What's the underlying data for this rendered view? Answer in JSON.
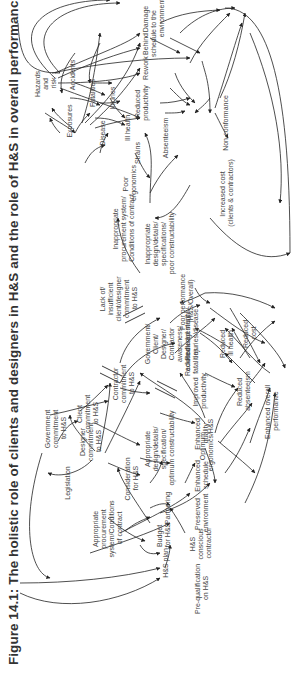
{
  "figure": {
    "title": "Figure 14.1: The holistic role of clients and designers in H&S and the role of H&S in overall performance",
    "orientation": "rotated 90 degrees counter-clockwise"
  },
  "left_diagram": {
    "nodes": [
      {
        "id": "legislation",
        "lines": [
          "Legislation"
        ]
      },
      {
        "id": "gov_commit",
        "lines": [
          "Government",
          "commitment",
          "to H&S"
        ]
      },
      {
        "id": "client_commit",
        "lines": [
          "Client",
          "commitment",
          "to H&S"
        ]
      },
      {
        "id": "designer_commit",
        "lines": [
          "Designer",
          "commitment",
          "to H&S"
        ]
      },
      {
        "id": "contractor_commit",
        "lines": [
          "Contractor",
          "commitment",
          "to H&S"
        ]
      },
      {
        "id": "approp_procurement",
        "lines": [
          "Appropriate",
          "procurement",
          "system/Conditions",
          "of contract"
        ]
      },
      {
        "id": "consideration",
        "lines": [
          "Consideration",
          "for H&S"
        ]
      },
      {
        "id": "approp_design",
        "lines": [
          "Appropriate",
          "design/details/",
          "specification/",
          "optimum constructability"
        ]
      },
      {
        "id": "hs_plan",
        "lines": [
          "H&S plan"
        ]
      },
      {
        "id": "budget",
        "lines": [
          "Budget",
          "for H&S"
        ]
      },
      {
        "id": "partnering",
        "lines": [
          "Partnering"
        ]
      },
      {
        "id": "prequal",
        "lines": [
          "Pre-qualification",
          "on H&S"
        ]
      },
      {
        "id": "hs_contractor",
        "lines": [
          "H&S",
          "conscious",
          "contractor"
        ]
      },
      {
        "id": "optimum_ergo",
        "lines": [
          "Optimum",
          "ergonomics/H&S"
        ]
      },
      {
        "id": "reduced_strains",
        "lines": [
          "Reduced strains/",
          "injuries/disease"
        ]
      },
      {
        "id": "reduced_fatal",
        "lines": [
          "Reduced",
          "fatalities"
        ]
      },
      {
        "id": "reduced_ill",
        "lines": [
          "Reduced",
          "ill health"
        ]
      },
      {
        "id": "reduced_cost",
        "lines": [
          "Reduced",
          "cost"
        ]
      },
      {
        "id": "improved_prod",
        "lines": [
          "Improved",
          "productivity"
        ]
      },
      {
        "id": "reduced_absent",
        "lines": [
          "Reduced",
          "absenteeism"
        ]
      },
      {
        "id": "enhanced_quality",
        "lines": [
          "Enhanced",
          "quality"
        ]
      },
      {
        "id": "enhanced_schedule",
        "lines": [
          "Enhanced",
          "schedule"
        ]
      },
      {
        "id": "preserved_env",
        "lines": [
          "Preserved",
          "environment"
        ]
      },
      {
        "id": "enhanced_overall",
        "lines": [
          "Enhanced overall",
          "performance"
        ]
      }
    ]
  },
  "middle": {
    "nodes": [
      {
        "id": "awareness",
        "lines": [
          "Government/",
          "Client/",
          "Designer/",
          "Contractor",
          "awareness/",
          "acknowledgement"
        ]
      },
      {
        "id": "lack_commit",
        "lines": [
          "Lack of/",
          "insufficient",
          "client/designer",
          "commitment",
          "to H&S"
        ]
      },
      {
        "id": "poor_perf",
        "lines": [
          "Poor performance",
          "(H&S/Overall)"
        ]
      }
    ]
  },
  "right_diagram": {
    "nodes": [
      {
        "id": "inapprop_procurement",
        "lines": [
          "Inappropriate",
          "procurement system/",
          "Conditions of contract"
        ]
      },
      {
        "id": "inapprop_design",
        "lines": [
          "Inappropriate",
          "design/details/",
          "specifications/",
          "poor constructability"
        ]
      },
      {
        "id": "hazards",
        "lines": [
          "Hazards",
          "and",
          "risk"
        ]
      },
      {
        "id": "poor_ergo",
        "lines": [
          "Poor",
          "ergonomics"
        ]
      },
      {
        "id": "strains",
        "lines": [
          "Strains"
        ]
      },
      {
        "id": "exposures",
        "lines": [
          "Exposures"
        ]
      },
      {
        "id": "disease",
        "lines": [
          "Disease"
        ]
      },
      {
        "id": "ill_health",
        "lines": [
          "Ill health"
        ]
      },
      {
        "id": "accidents",
        "lines": [
          "Accidents"
        ]
      },
      {
        "id": "fatalities",
        "lines": [
          "Fatalities"
        ]
      },
      {
        "id": "injuries",
        "lines": [
          "Injuries"
        ]
      },
      {
        "id": "absenteeism",
        "lines": [
          "Absenteeism"
        ]
      },
      {
        "id": "reduced_productivity",
        "lines": [
          "Reduced",
          "productivity"
        ]
      },
      {
        "id": "rework",
        "lines": [
          "Rework"
        ]
      },
      {
        "id": "behind_schedule",
        "lines": [
          "Behind",
          "schedule"
        ]
      },
      {
        "id": "damage_env",
        "lines": [
          "Damage",
          "to the",
          "environment"
        ]
      },
      {
        "id": "non_conformance",
        "lines": [
          "Non-conformance"
        ]
      },
      {
        "id": "increased_cost",
        "lines": [
          "Increased cost",
          "(clients & contractors)"
        ]
      }
    ]
  },
  "colors": {
    "text": "#444444",
    "title": "#333333",
    "lines": "#222222",
    "background": "#ffffff"
  }
}
